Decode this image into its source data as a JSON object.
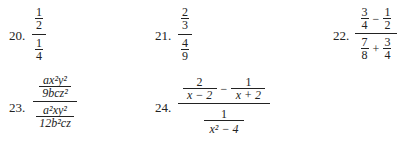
{
  "problems": [
    {
      "number": "20.",
      "top": {
        "num": "1",
        "den": "2"
      },
      "bottom": {
        "num": "1",
        "den": "4"
      }
    },
    {
      "number": "21.",
      "top": {
        "num": "2",
        "den": "3"
      },
      "bottom": {
        "num": "4",
        "den": "9"
      }
    },
    {
      "number": "22.",
      "top": {
        "a_num": "3",
        "a_den": "4",
        "op": "−",
        "b_num": "1",
        "b_den": "2"
      },
      "bottom": {
        "a_num": "7",
        "a_den": "8",
        "op": "+",
        "b_num": "3",
        "b_den": "4"
      }
    },
    {
      "number": "23.",
      "top": {
        "num": "ax²y²",
        "den": "9bcz²"
      },
      "bottom": {
        "num": "a²xy²",
        "den": "12b²cz"
      }
    },
    {
      "number": "24.",
      "top": {
        "a_num": "2",
        "a_den": "x − 2",
        "op": "−",
        "b_num": "1",
        "b_den": "x + 2"
      },
      "bottom": {
        "num": "1",
        "den": "x² − 4"
      }
    }
  ]
}
